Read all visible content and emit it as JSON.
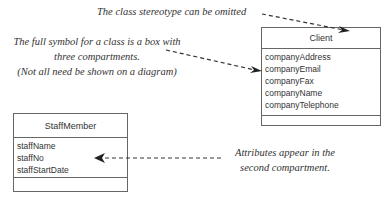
{
  "notes": {
    "stereotype": "The class stereotype can be omitted",
    "full_symbol_line1": "The full symbol for a class is a box with",
    "full_symbol_line2": "three compartments.",
    "full_symbol_line3": "(Not all need be shown on a diagram)",
    "attributes_line1": "Attributes appear in the",
    "attributes_line2": "second compartment."
  },
  "classes": {
    "client": {
      "name": "Client",
      "attributes": [
        "companyAddress",
        "companyEmail",
        "companyFax",
        "companyName",
        "companyTelephone"
      ]
    },
    "staff": {
      "name": "StaffMember",
      "attributes": [
        "staffName",
        "staffNo",
        "staffStartDate"
      ]
    }
  }
}
